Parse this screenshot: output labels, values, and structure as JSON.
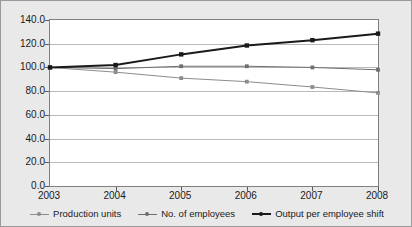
{
  "chart_data": {
    "type": "line",
    "title": "",
    "xlabel": "",
    "ylabel": "",
    "categories": [
      "2003",
      "2004",
      "2005",
      "2006",
      "2007",
      "2008"
    ],
    "x": [
      2003,
      2004,
      2005,
      2006,
      2007,
      2008
    ],
    "ylim": [
      0.0,
      140.0
    ],
    "yticks": [
      "0.0",
      "20.0",
      "40.0",
      "60.0",
      "80.0",
      "100.0",
      "120.0",
      "140.0"
    ],
    "ytick_values": [
      0.0,
      20.0,
      40.0,
      60.0,
      80.0,
      100.0,
      120.0,
      140.0
    ],
    "grid": true,
    "legend_position": "bottom",
    "series": [
      {
        "name": "Production units",
        "values": [
          100.0,
          96.0,
          91.0,
          88.0,
          83.5,
          78.5
        ],
        "color": "#8c8c8c",
        "width": 1.0
      },
      {
        "name": "No. of employees",
        "values": [
          100.0,
          99.0,
          101.0,
          101.0,
          100.0,
          98.0
        ],
        "color": "#6e6e6e",
        "width": 1.0
      },
      {
        "name": "Output per employee shift",
        "values": [
          100.0,
          102.0,
          111.0,
          118.5,
          123.0,
          128.5
        ],
        "color": "#1a1a1a",
        "width": 2.0
      }
    ]
  },
  "figure": {
    "background": "#e9e9e9",
    "plot_background": "#ffffff",
    "border_color": "#9a9a9a",
    "gridline_color": "#b9b9b9"
  }
}
